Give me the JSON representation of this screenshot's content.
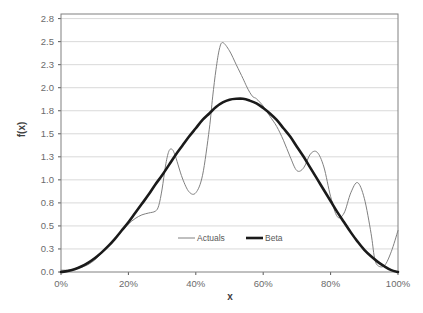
{
  "chart_data": {
    "type": "line",
    "title": "",
    "xlabel": "x",
    "ylabel": "f(x)",
    "xlim": [
      0,
      1
    ],
    "ylim": [
      0.0,
      2.8
    ],
    "grid": true,
    "legend_position": "bottom-center",
    "x_tick_labels": [
      "0%",
      "20%",
      "40%",
      "60%",
      "80%",
      "100%"
    ],
    "x_tick_values": [
      0,
      0.2,
      0.4,
      0.6,
      0.8,
      1.0
    ],
    "y_tick_labels": [
      "0.0",
      "0.3",
      "0.5",
      "0.8",
      "1.0",
      "1.3",
      "1.5",
      "1.8",
      "2.0",
      "2.3",
      "2.5",
      "2.8"
    ],
    "y_tick_values": [
      0.0,
      0.25,
      0.5,
      0.75,
      1.0,
      1.25,
      1.5,
      1.75,
      2.0,
      2.25,
      2.5,
      2.75
    ],
    "series": [
      {
        "name": "Actuals",
        "color": "#808080",
        "line_width": 1,
        "x": [
          0.0,
          0.02,
          0.04,
          0.06,
          0.08,
          0.1,
          0.12,
          0.14,
          0.16,
          0.18,
          0.2,
          0.22,
          0.24,
          0.26,
          0.28,
          0.29,
          0.3,
          0.31,
          0.32,
          0.33,
          0.34,
          0.36,
          0.38,
          0.4,
          0.42,
          0.44,
          0.45,
          0.46,
          0.47,
          0.48,
          0.5,
          0.52,
          0.54,
          0.55,
          0.56,
          0.57,
          0.58,
          0.6,
          0.62,
          0.64,
          0.66,
          0.68,
          0.7,
          0.72,
          0.74,
          0.76,
          0.78,
          0.8,
          0.82,
          0.84,
          0.86,
          0.88,
          0.9,
          0.92,
          0.93,
          0.94,
          0.96,
          0.98,
          1.0
        ],
        "y": [
          0.02,
          0.02,
          0.03,
          0.05,
          0.08,
          0.13,
          0.2,
          0.28,
          0.36,
          0.44,
          0.52,
          0.58,
          0.62,
          0.64,
          0.66,
          0.72,
          0.9,
          1.15,
          1.31,
          1.33,
          1.25,
          1.02,
          0.87,
          0.86,
          1.05,
          1.55,
          1.9,
          2.2,
          2.42,
          2.49,
          2.4,
          2.25,
          2.1,
          2.02,
          1.95,
          1.9,
          1.88,
          1.8,
          1.69,
          1.58,
          1.43,
          1.25,
          1.1,
          1.13,
          1.28,
          1.3,
          1.14,
          0.82,
          0.6,
          0.64,
          0.86,
          0.97,
          0.8,
          0.42,
          0.16,
          0.07,
          0.07,
          0.22,
          0.45
        ]
      },
      {
        "name": "Beta",
        "color": "#1a1a1a",
        "line_width": 2.6,
        "x": [
          0.0,
          0.02,
          0.04,
          0.06,
          0.08,
          0.1,
          0.12,
          0.14,
          0.16,
          0.18,
          0.2,
          0.22,
          0.24,
          0.26,
          0.28,
          0.3,
          0.32,
          0.34,
          0.36,
          0.38,
          0.4,
          0.42,
          0.44,
          0.46,
          0.48,
          0.5,
          0.52,
          0.54,
          0.56,
          0.58,
          0.6,
          0.62,
          0.64,
          0.66,
          0.68,
          0.7,
          0.72,
          0.74,
          0.76,
          0.78,
          0.8,
          0.82,
          0.84,
          0.86,
          0.88,
          0.9,
          0.92,
          0.94,
          0.96,
          0.98,
          1.0
        ],
        "y": [
          0.0,
          0.01,
          0.03,
          0.06,
          0.1,
          0.15,
          0.21,
          0.28,
          0.36,
          0.45,
          0.54,
          0.64,
          0.74,
          0.84,
          0.95,
          1.05,
          1.16,
          1.27,
          1.37,
          1.47,
          1.56,
          1.65,
          1.72,
          1.79,
          1.84,
          1.87,
          1.88,
          1.88,
          1.86,
          1.83,
          1.78,
          1.72,
          1.65,
          1.56,
          1.47,
          1.36,
          1.25,
          1.13,
          1.01,
          0.89,
          0.77,
          0.65,
          0.54,
          0.43,
          0.33,
          0.24,
          0.17,
          0.11,
          0.06,
          0.02,
          0.0
        ]
      }
    ],
    "legend": [
      {
        "label": "Actuals",
        "color": "#808080",
        "line_width": 1
      },
      {
        "label": "Beta",
        "color": "#1a1a1a",
        "line_width": 2.6
      }
    ],
    "colors": {
      "grid": "#d9d9d9",
      "axis": "#595959",
      "plot_background": "#ffffff",
      "text": "#595959"
    }
  }
}
